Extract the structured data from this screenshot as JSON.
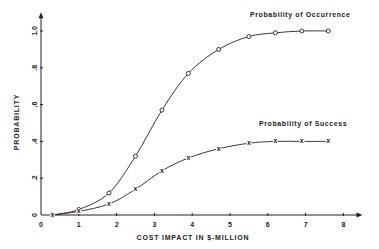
{
  "chart_data": {
    "type": "line",
    "title": "",
    "xlabel": "COST IMPACT IN $-MILLION",
    "ylabel": "PROBABILITY",
    "xlim": [
      0,
      8
    ],
    "ylim": [
      0,
      1.0
    ],
    "grid": false,
    "x_ticks": [
      "0",
      "1",
      "2",
      "3",
      "4",
      "5",
      "6",
      "7",
      "8"
    ],
    "y_ticks": [
      "0",
      ".2",
      ".4",
      ".6",
      ".8",
      "1.0"
    ],
    "legend_position": "inline labels near curves",
    "series": [
      {
        "name": "Probability of Occurrence",
        "marker": "circle",
        "x": [
          0.3,
          1.0,
          1.8,
          2.5,
          3.2,
          3.9,
          4.7,
          5.5,
          6.2,
          6.9,
          7.6
        ],
        "values": [
          0.0,
          0.03,
          0.12,
          0.32,
          0.57,
          0.77,
          0.9,
          0.97,
          0.99,
          1.0,
          1.0
        ]
      },
      {
        "name": "Probability of Success",
        "marker": "x",
        "x": [
          0.3,
          1.0,
          1.8,
          2.5,
          3.2,
          3.9,
          4.7,
          5.5,
          6.2,
          6.9,
          7.6
        ],
        "values": [
          0.0,
          0.02,
          0.06,
          0.14,
          0.24,
          0.31,
          0.36,
          0.39,
          0.4,
          0.4,
          0.4
        ]
      }
    ]
  },
  "labels": {
    "xlabel": "COST IMPACT IN $-MILLION",
    "ylabel": "PROBABILITY",
    "occurrence": "Probability of Occurrence",
    "success": "Probability of Success"
  }
}
